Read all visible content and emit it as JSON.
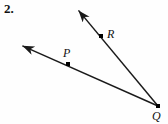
{
  "figure": {
    "problem_number": "2.",
    "background_color": "#fefefe",
    "stroke_color": "#1a1a1a",
    "stroke_width": 1.5,
    "dot_color": "#000000",
    "dot_size": 4,
    "points": [
      {
        "name": "P",
        "label": "P",
        "x": 68,
        "y": 64
      },
      {
        "name": "R",
        "label": "R",
        "x": 101,
        "y": 36
      },
      {
        "name": "Q",
        "label": "Q",
        "x": 158,
        "y": 106
      }
    ],
    "rays": [
      {
        "name": "ray-QR",
        "from": {
          "x": 158,
          "y": 106
        },
        "to": {
          "x": 74,
          "y": 5
        },
        "arrow_at": "to",
        "through_point": "R"
      },
      {
        "name": "ray-QP",
        "from": {
          "x": 158,
          "y": 106
        },
        "to": {
          "x": 16,
          "y": 43
        },
        "arrow_at": "to",
        "through_point": "P"
      }
    ]
  }
}
